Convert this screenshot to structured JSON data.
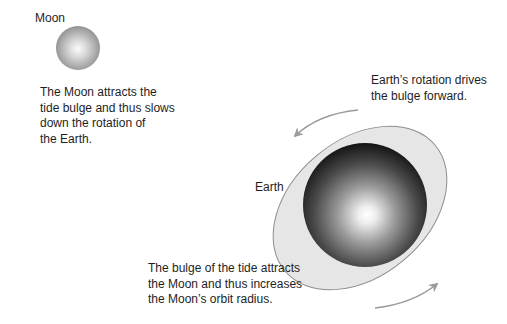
{
  "diagram": {
    "colors": {
      "background": "#ffffff",
      "text": "#1e1e1e",
      "arrow": "#9a9a9a",
      "bulge_fill": "#e6e6e6",
      "bulge_stroke": "#8c8c8c",
      "earth_dark": "#141414",
      "earth_light": "#ffffff",
      "moon_dark": "#8a8a8a",
      "moon_light": "#fbfbfb"
    },
    "bodies": {
      "moon": {
        "label": "Moon",
        "center": [
          78,
          48
        ],
        "radius": 22
      },
      "earth": {
        "label": "Earth",
        "center": [
          365,
          205
        ],
        "radius": 62
      },
      "tidal_bulge": {
        "center": [
          360,
          208
        ],
        "rx": 98,
        "ry": 68,
        "rotation_deg": -40
      }
    },
    "captions": {
      "moon_effect": {
        "lines": [
          "The Moon attracts the",
          "tide bulge and thus slows",
          "down the rotation of",
          "the Earth."
        ]
      },
      "earth_rotation": {
        "lines": [
          "Earth’s rotation drives",
          "the bulge forward."
        ]
      },
      "bulge_effect": {
        "lines": [
          "The bulge of the tide attracts",
          "the Moon and thus increases",
          "the Moon’s orbit radius."
        ]
      }
    },
    "arrows": [
      {
        "name": "rotation-arrow-top",
        "from": [
          358,
          110
        ],
        "to": [
          293,
          137
        ],
        "direction": "counter-clockwise"
      },
      {
        "name": "rotation-arrow-bottom",
        "from": [
          375,
          307
        ],
        "to": [
          438,
          283
        ],
        "direction": "counter-clockwise"
      }
    ]
  }
}
